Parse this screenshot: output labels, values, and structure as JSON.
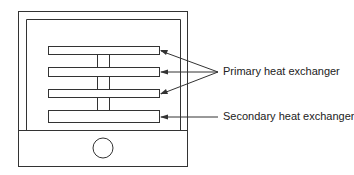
{
  "diagram": {
    "labels": {
      "primary": "Primary heat exchanger",
      "secondary": "Secondary heat exchanger"
    },
    "colors": {
      "stroke": "#333333",
      "background": "#ffffff"
    }
  }
}
